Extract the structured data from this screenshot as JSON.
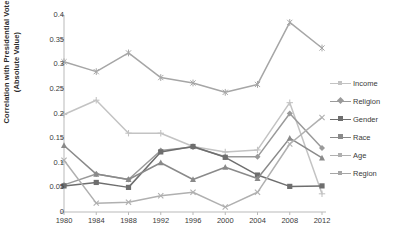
{
  "chart_data": {
    "type": "line",
    "title": "",
    "xlabel": "",
    "ylabel": "Correlation with Presidential Vote (Absolute Value)",
    "categories": [
      "1980",
      "1984",
      "1988",
      "1992",
      "1996",
      "2000",
      "2004",
      "2008",
      "2012"
    ],
    "ylim": [
      0,
      0.4
    ],
    "yticks": [
      "0",
      "0.05",
      "0.1",
      "0.15",
      "0.2",
      "0.25",
      "0.3",
      "0.35",
      "0.4"
    ],
    "ytick_values": [
      0,
      0.05,
      0.1,
      0.15,
      0.2,
      0.25,
      0.3,
      0.35,
      0.4
    ],
    "grid": false,
    "legend_position": "right",
    "series": [
      {
        "name": "Income",
        "color": "#c3c3c3",
        "marker": "plus",
        "values": [
          0.198,
          0.227,
          0.16,
          0.16,
          0.133,
          0.122,
          0.126,
          0.222,
          0.037
        ]
      },
      {
        "name": "Religion",
        "color": "#9a9a9a",
        "marker": "diamond",
        "values": [
          0.055,
          0.077,
          0.066,
          0.125,
          0.132,
          0.112,
          0.112,
          0.2,
          0.13
        ]
      },
      {
        "name": "Gender",
        "color": "#6e6e6e",
        "marker": "square",
        "values": [
          0.053,
          0.06,
          0.05,
          0.122,
          0.133,
          0.111,
          0.075,
          0.052,
          0.053
        ]
      },
      {
        "name": "Race",
        "color": "#8a8a8a",
        "marker": "triangle",
        "values": [
          0.135,
          0.077,
          0.066,
          0.1,
          0.066,
          0.091,
          0.068,
          0.15,
          0.11
        ]
      },
      {
        "name": "Age",
        "color": "#b0b0b0",
        "marker": "cross",
        "values": [
          0.105,
          0.018,
          0.02,
          0.033,
          0.04,
          0.01,
          0.04,
          0.138,
          0.192
        ]
      },
      {
        "name": "Region",
        "color": "#a6a6a6",
        "marker": "star",
        "values": [
          0.305,
          0.285,
          0.323,
          0.273,
          0.262,
          0.243,
          0.259,
          0.385,
          0.333
        ]
      }
    ]
  },
  "legend": {
    "items": [
      {
        "label": "Income"
      },
      {
        "label": "Religion"
      },
      {
        "label": "Gender"
      },
      {
        "label": "Race"
      },
      {
        "label": "Age"
      },
      {
        "label": "Region"
      }
    ]
  }
}
